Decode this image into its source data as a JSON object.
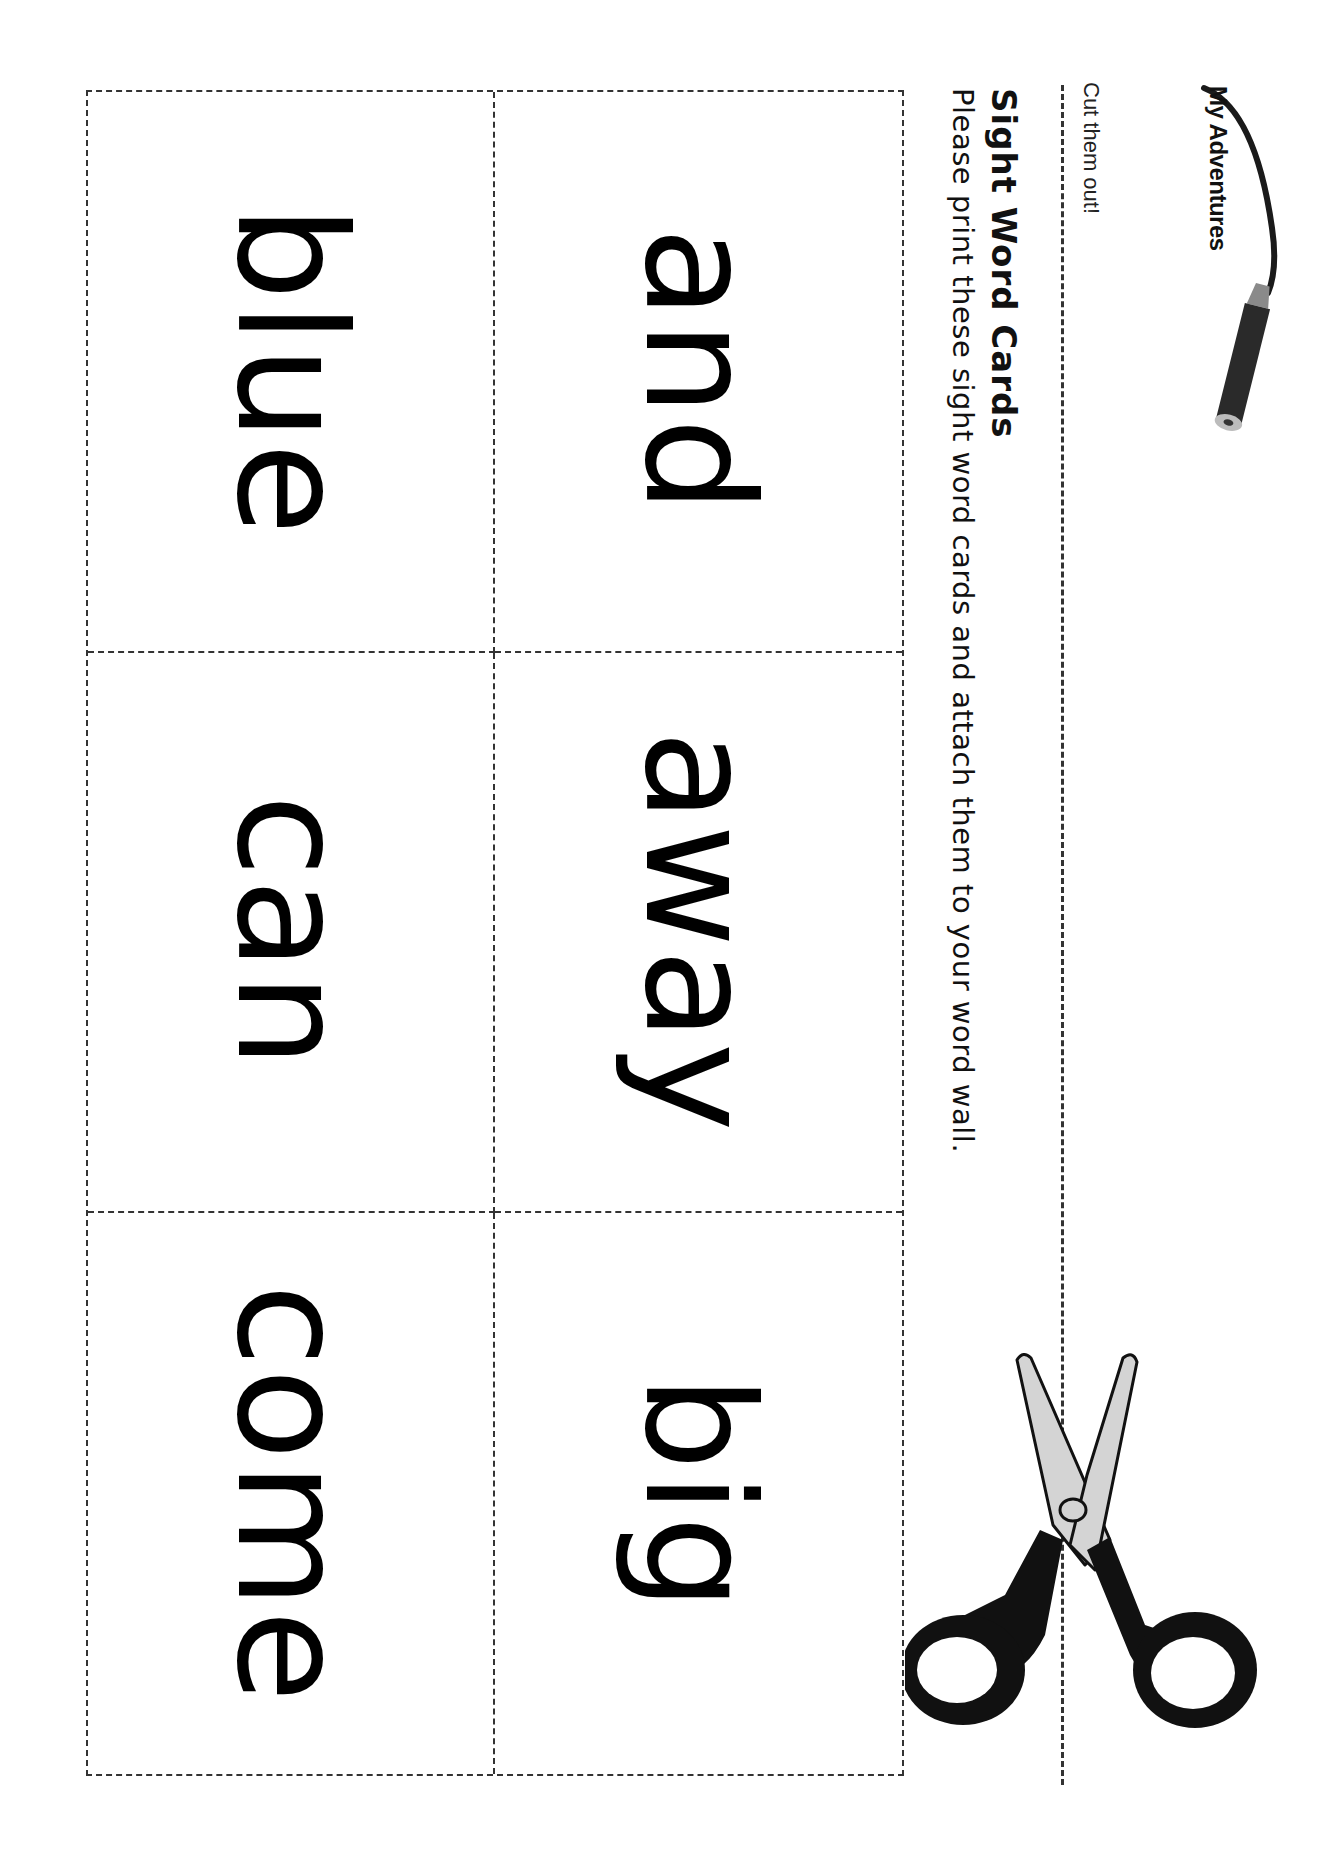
{
  "brand": {
    "logo_text": "My Adventures",
    "logo_icon": "pencil-swoosh-icon"
  },
  "header": {
    "cut_label": "Cut them out!",
    "title": "Sight Word Cards",
    "instructions": "Please print these sight word cards and attach them to your word wall."
  },
  "cards": [
    {
      "word": "and"
    },
    {
      "word": "blue"
    },
    {
      "word": "away"
    },
    {
      "word": "can"
    },
    {
      "word": "big"
    },
    {
      "word": "come"
    }
  ],
  "decor": {
    "scissors_icon": "scissors-icon",
    "colors": {
      "ink": "#000000",
      "blade": "#d4d4d4",
      "handle": "#111111",
      "dash": "#333333"
    }
  }
}
